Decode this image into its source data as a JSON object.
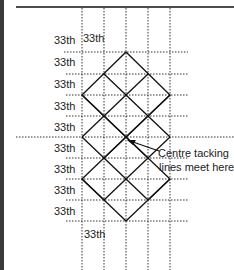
{
  "diagram": {
    "row_label": "33th",
    "left_labels": [
      "33th",
      "33th",
      "33th",
      "33th",
      "33th",
      "33th",
      "33th",
      "33th",
      "33th"
    ],
    "top_label": "33th",
    "bottom_label": "33th",
    "annotation": {
      "line1": "Centre tacking",
      "line2": "lines meet here"
    },
    "colors": {
      "line": "#111111",
      "dotted": "#333333",
      "text": "#222222",
      "background": "#ffffff"
    }
  }
}
